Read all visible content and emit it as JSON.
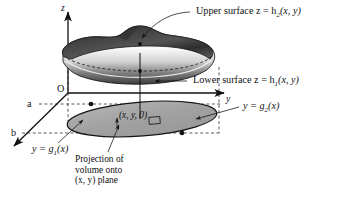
{
  "figure": {
    "background_color": "#ffffff",
    "ink_color": "#111111",
    "projection_fill": "#a8a8a8",
    "solid_top_color": "#3a3a3a",
    "solid_side_light": "#f2f2f2"
  },
  "axes": {
    "z_label": "z",
    "y_label": "y",
    "origin_label": "O",
    "x_tick_a": "a",
    "x_tick_b": "b"
  },
  "annotations": {
    "upper_surface": "Upper surface z = h",
    "upper_surface_sub": "2",
    "upper_surface_args": "(x, y)",
    "lower_surface": "Lower surface z = h",
    "lower_surface_sub": "1",
    "lower_surface_args": "(x, y)",
    "g1": "y = g",
    "g1_sub": "1",
    "g1_args": "(x)",
    "g2": "y = g",
    "g2_sub": "2",
    "g2_args": "(x)",
    "point_label": "(x, y, 0)",
    "projection_line1": "Projection of",
    "projection_line2": "volume onto",
    "projection_line3": "(x, y) plane"
  }
}
